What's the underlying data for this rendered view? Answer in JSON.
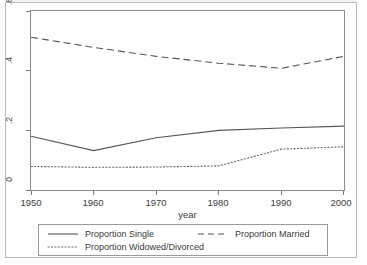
{
  "chart_data": {
    "type": "line",
    "title": "",
    "subtitle": "",
    "xlabel": "year",
    "ylabel": "",
    "xlim": [
      1950,
      2000
    ],
    "ylim": [
      0,
      0.6
    ],
    "grid": false,
    "legend_position": "bottom",
    "xticks": [
      "1950",
      "1960",
      "1970",
      "1980",
      "1990",
      "2000"
    ],
    "xtick_values": [
      1950,
      1960,
      1970,
      1980,
      1990,
      2000
    ],
    "yticks": [
      "0",
      ".2",
      ".4",
      ".6"
    ],
    "ytick_values": [
      0,
      0.2,
      0.4,
      0.6
    ],
    "x": [
      1950,
      1960,
      1970,
      1980,
      1990,
      2000
    ],
    "series": [
      {
        "name": "Proportion Single",
        "style": "solid",
        "color": "#555555",
        "values": [
          0.18,
          0.132,
          0.175,
          0.2,
          0.208,
          0.214
        ]
      },
      {
        "name": "Proportion Married",
        "style": "dashed",
        "color": "#555555",
        "values": [
          0.512,
          0.478,
          0.448,
          0.425,
          0.408,
          0.448
        ]
      },
      {
        "name": "Proportion Widowed/Divorced",
        "style": "dotted",
        "color": "#666666",
        "values": [
          0.079,
          0.076,
          0.077,
          0.081,
          0.137,
          0.145
        ]
      }
    ]
  },
  "axis": {
    "x_title": "year",
    "x_tick_labels": [
      "1950",
      "1960",
      "1970",
      "1980",
      "1990",
      "2000"
    ],
    "y_tick_labels": [
      "0",
      ".2",
      ".4",
      ".6"
    ]
  },
  "legend": {
    "items": [
      {
        "label": "Proportion Single",
        "style": "solid"
      },
      {
        "label": "Proportion Widowed/Divorced",
        "style": "dotted"
      },
      {
        "label": "Proportion Married",
        "style": "dashed"
      }
    ]
  },
  "colors": {
    "line": "#555555",
    "axis": "#8c8c8c",
    "text": "#3d3d3d",
    "frame": "#b9b9b9",
    "background": "#fdfdfd"
  }
}
